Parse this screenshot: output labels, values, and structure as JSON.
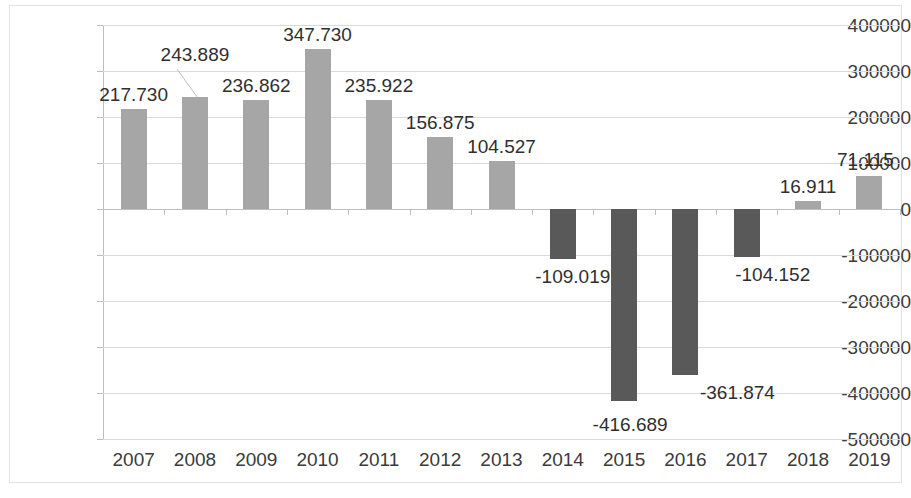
{
  "chart_data": {
    "type": "bar",
    "title": "",
    "subtitle": "",
    "xlabel": "",
    "ylabel": "",
    "categories": [
      "2007",
      "2008",
      "2009",
      "2010",
      "2011",
      "2012",
      "2013",
      "2014",
      "2015",
      "2016",
      "2017",
      "2018",
      "2019"
    ],
    "values": [
      217730,
      243889,
      236862,
      347730,
      235922,
      156875,
      104527,
      -109019,
      -416689,
      -361874,
      -104152,
      16911,
      71115
    ],
    "data_labels": [
      "217.730",
      "243.889",
      "236.862",
      "347.730",
      "235.922",
      "156.875",
      "104.527",
      "-109.019",
      "-416.689",
      "-361.874",
      "-104.152",
      "16.911",
      "71.115"
    ],
    "ylim": [
      -500000,
      400000
    ],
    "ytick_step": 100000,
    "ytick_labels": [
      "400000",
      "300000",
      "200000",
      "100000",
      "0",
      "-100000",
      "-200000",
      "-300000",
      "-400000",
      "-500000"
    ],
    "ytick_values": [
      400000,
      300000,
      200000,
      100000,
      0,
      -100000,
      -200000,
      -300000,
      -400000,
      -500000
    ],
    "grid": true,
    "legend": "none",
    "colors": {
      "positive_bar": "#a6a6a6",
      "negative_bar": "#595959",
      "gridline": "#d9d9d9",
      "axis": "#bfbfbf",
      "text": "#3b3b3b",
      "background": "#ffffff"
    },
    "label_leader_lines": [
      {
        "category": "2008",
        "label": "243.889"
      }
    ]
  }
}
